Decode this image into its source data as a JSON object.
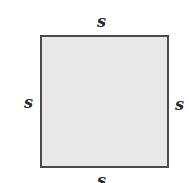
{
  "diagram": {
    "shape": "square",
    "fill_color": "#e8e8e8",
    "stroke_color": "#4a4a4a",
    "labels": {
      "top": "s",
      "left": "s",
      "right": "s",
      "bottom": "s"
    }
  }
}
